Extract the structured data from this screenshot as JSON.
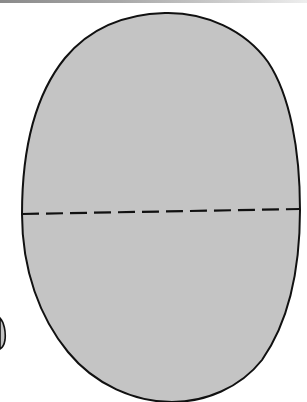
{
  "figure": {
    "description": "Oval pattern piece with dashed fold line",
    "shape": {
      "fill": "#c4c4c4",
      "stroke": "#111111"
    },
    "fold_line": {
      "style": "dashed",
      "stroke": "#111111"
    },
    "edge_fragment": {
      "fill": "#c4c4c4",
      "stroke": "#111111"
    },
    "top_border_color": "#8a8a8a"
  }
}
